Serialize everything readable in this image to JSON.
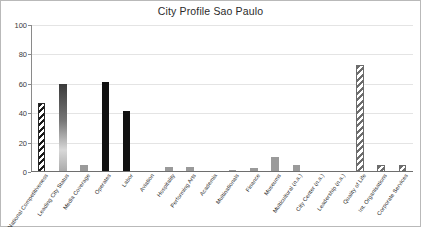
{
  "chart_data": {
    "type": "bar",
    "title": "City Profile Sao Paulo",
    "xlabel": "",
    "ylabel": "",
    "ylim": [
      0,
      100
    ],
    "yticks": [
      0,
      20,
      40,
      60,
      80,
      100
    ],
    "grid": true,
    "legend": "none",
    "categories": [
      "National Competitiveness",
      "Leading City Status",
      "Media Coverage",
      "Operates",
      "Labor",
      "Aviation",
      "Hospitality",
      "Performing Arts",
      "Academia",
      "Multinationals",
      "Finance",
      "Museums",
      "Multicultural (n.a.)",
      "City Center (n.a.)",
      "Leadership (n.a.)",
      "Quality of Life",
      "Int. Organisations",
      "Corporate Services"
    ],
    "values": [
      47,
      60,
      5,
      61,
      41.5,
      0,
      3.5,
      3.5,
      0,
      1.5,
      3,
      10,
      5,
      0,
      0,
      73,
      5,
      5
    ],
    "bar_styles": [
      "hatch",
      "gradient",
      "grey",
      "solid-dark",
      "solid-dark",
      "none",
      "grey",
      "grey",
      "none",
      "grey",
      "grey",
      "grey",
      "grey",
      "none",
      "none",
      "hatch-grey",
      "hatch-grey",
      "hatch-grey"
    ]
  },
  "axis": {
    "y_tick_labels": [
      "0",
      "20",
      "40",
      "60",
      "80",
      "100"
    ]
  },
  "colors": {
    "frame": "#b9b9b9",
    "grid": "#e4e4e4",
    "axis": "#6e6e6e",
    "bar_dark": "#111111",
    "bar_grey": "#9a9a9a",
    "text": "#2b2b2b",
    "background": "#ffffff"
  }
}
